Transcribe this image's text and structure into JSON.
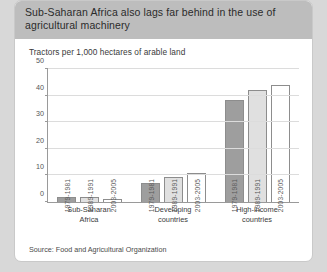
{
  "card": {
    "title": "Sub-Saharan Africa also lags far behind in the use of agricultural machinery",
    "source": "Source: Food and Agricultural Organization"
  },
  "chart_data": {
    "type": "bar",
    "title": "Sub-Saharan Africa also lags far behind in the use of agricultural machinery",
    "subtitle": "Tractors per 1,000 hectares of arable land",
    "xlabel": "",
    "ylabel": "",
    "ylim": [
      0,
      50
    ],
    "yticks": [
      0,
      10,
      20,
      30,
      40,
      50
    ],
    "ytick_labels": [
      "0",
      "10",
      "20",
      "30",
      "40",
      "50"
    ],
    "grid": true,
    "legend": "none",
    "categories": [
      "Sub-Saharan Africa",
      "Developing countries",
      "High-income countries"
    ],
    "category_lines": [
      [
        "Sub-Saharan",
        "Africa"
      ],
      [
        "Developing",
        "countries"
      ],
      [
        "High-income",
        "countries"
      ]
    ],
    "series": [
      {
        "name": "1979-1981",
        "color": "#9e9e9e",
        "values": [
          2.0,
          7.0,
          38.5
        ]
      },
      {
        "name": "1989-1991",
        "color": "#e0e0e0",
        "values": [
          2.0,
          9.5,
          42.0
        ]
      },
      {
        "name": "2003-2005",
        "color": "#ffffff",
        "values": [
          1.2,
          11.0,
          44.0
        ]
      }
    ],
    "source": "Source: Food and Agricultural Organization"
  }
}
